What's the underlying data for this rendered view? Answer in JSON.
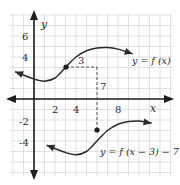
{
  "chart_data": {
    "type": "line",
    "title": "",
    "xlabel": "x",
    "ylabel": "y",
    "xlim": [
      -2.5,
      11.5
    ],
    "ylim": [
      -7.5,
      8.5
    ],
    "grid": true,
    "x_ticks": [
      2,
      4,
      8
    ],
    "y_ticks": [
      6,
      4,
      -2,
      -4
    ],
    "series": [
      {
        "name": "y = f (x)",
        "label": "y = f (x)",
        "points": [
          [
            -1.8,
            2.6
          ],
          [
            0,
            1.9
          ],
          [
            1,
            1.7
          ],
          [
            2,
            2.0
          ],
          [
            3,
            3.0
          ],
          [
            4,
            4.0
          ],
          [
            5,
            4.6
          ],
          [
            6,
            4.85
          ],
          [
            7,
            4.9
          ],
          [
            8,
            4.75
          ],
          [
            9.4,
            4.3
          ]
        ],
        "marked_point": [
          3,
          3
        ],
        "marked_label": "3"
      },
      {
        "name": "y = f (x − 3) − 7",
        "label": "y = f (x − 3) − 7",
        "points": [
          [
            1.2,
            -4.4
          ],
          [
            3,
            -5.1
          ],
          [
            4,
            -5.3
          ],
          [
            5,
            -5.0
          ],
          [
            6,
            -4.0
          ],
          [
            7,
            -3.0
          ],
          [
            8,
            -2.4
          ],
          [
            9,
            -2.15
          ],
          [
            10,
            -2.1
          ],
          [
            11.2,
            -2.3
          ]
        ],
        "marked_point": [
          6,
          -4
        ],
        "marked_label": "7"
      }
    ],
    "annotations": [
      {
        "text": "3",
        "meaning": "horizontal shift of 3 units (dashed line from (3,3) to (6,3))"
      },
      {
        "text": "7",
        "meaning": "vertical shift of 7 units down (dashed line from (6,3) to (6,-4))"
      }
    ]
  },
  "labels": {
    "x_axis": "x",
    "y_axis": "y",
    "tick_2": "2",
    "tick_4": "4",
    "tick_8": "8",
    "tick_y6": "6",
    "tick_y4": "4",
    "tick_yn2": "-2",
    "tick_yn4": "-4",
    "shift_h": "3",
    "shift_v": "7",
    "eq_original": "y = f (x)",
    "eq_transformed": "y = f (x − 3) − 7"
  },
  "colors": {
    "grid": "#d4d4d4",
    "axis": "#1e1e1e",
    "curve": "#2b2b2b",
    "text": "#2a2a2a"
  }
}
